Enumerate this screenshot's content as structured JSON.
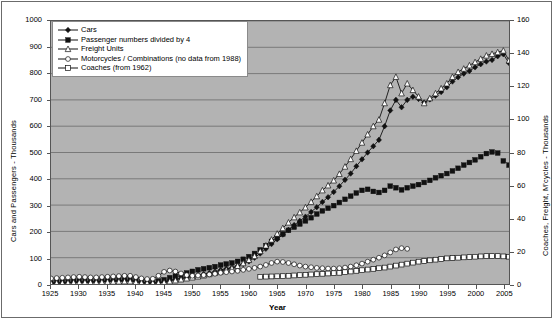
{
  "chart_data": {
    "type": "line",
    "title": "",
    "xlabel": "Year",
    "ylabel": "Cars and Passengers - Thousands",
    "y2label": "Coaches, Freight, M'cycles - Thousands",
    "xlim": [
      1925,
      2006
    ],
    "ylim": [
      0,
      1000
    ],
    "y2lim": [
      0,
      160
    ],
    "ytick_step": 100,
    "y2tick_step": 20,
    "xtick_step": 5,
    "grid": "horizontal",
    "legend_position": "top-left-inside",
    "plot_background": "#b3b3b3",
    "yticks": [
      0,
      100,
      200,
      300,
      400,
      500,
      600,
      700,
      800,
      900,
      1000
    ],
    "y2ticks": [
      0,
      20,
      40,
      60,
      80,
      100,
      120,
      140,
      160
    ],
    "xticks": [
      1925,
      1930,
      1935,
      1940,
      1945,
      1950,
      1955,
      1960,
      1965,
      1970,
      1975,
      1980,
      1985,
      1990,
      1995,
      2000,
      2005
    ],
    "series": [
      {
        "name": "Cars",
        "axis": "left",
        "marker": "filled-diamond",
        "color": "#1a1a1a",
        "line": true,
        "x": [
          1925,
          1926,
          1927,
          1928,
          1929,
          1930,
          1931,
          1932,
          1933,
          1934,
          1935,
          1936,
          1937,
          1938,
          1939,
          1940,
          1941,
          1942,
          1943,
          1944,
          1945,
          1946,
          1947,
          1948,
          1949,
          1950,
          1951,
          1952,
          1953,
          1954,
          1955,
          1956,
          1957,
          1958,
          1959,
          1960,
          1961,
          1962,
          1963,
          1964,
          1965,
          1966,
          1967,
          1968,
          1969,
          1970,
          1971,
          1972,
          1973,
          1974,
          1975,
          1976,
          1977,
          1978,
          1979,
          1980,
          1981,
          1982,
          1983,
          1984,
          1985,
          1986,
          1987,
          1988,
          1989,
          1990,
          1991,
          1992,
          1993,
          1994,
          1995,
          1996,
          1997,
          1998,
          1999,
          2000,
          2001,
          2002,
          2003,
          2004,
          2005,
          2006
        ],
        "y": [
          3,
          4,
          5,
          6,
          7,
          8,
          8,
          8,
          9,
          10,
          11,
          12,
          13,
          14,
          14,
          10,
          6,
          4,
          4,
          5,
          8,
          14,
          18,
          22,
          26,
          30,
          34,
          38,
          42,
          47,
          53,
          58,
          62,
          68,
          76,
          86,
          100,
          116,
          134,
          152,
          170,
          188,
          206,
          224,
          240,
          256,
          274,
          292,
          312,
          330,
          350,
          372,
          396,
          420,
          448,
          474,
          500,
          524,
          548,
          600,
          660,
          700,
          672,
          700,
          712,
          704,
          690,
          702,
          716,
          730,
          748,
          770,
          786,
          800,
          810,
          824,
          836,
          846,
          852,
          866,
          874,
          840
        ]
      },
      {
        "name": "Passenger numbers divided by 4",
        "axis": "left",
        "marker": "filled-square",
        "color": "#1a1a1a",
        "line": false,
        "x": [
          1925,
          1926,
          1927,
          1928,
          1929,
          1930,
          1931,
          1932,
          1933,
          1934,
          1935,
          1936,
          1937,
          1938,
          1939,
          1940,
          1941,
          1942,
          1943,
          1944,
          1945,
          1946,
          1947,
          1948,
          1949,
          1950,
          1951,
          1952,
          1953,
          1954,
          1955,
          1956,
          1957,
          1958,
          1959,
          1960,
          1961,
          1962,
          1963,
          1964,
          1965,
          1966,
          1967,
          1968,
          1969,
          1970,
          1971,
          1972,
          1973,
          1974,
          1975,
          1976,
          1977,
          1978,
          1979,
          1980,
          1981,
          1982,
          1983,
          1984,
          1985,
          1986,
          1987,
          1988,
          1989,
          1990,
          1991,
          1992,
          1993,
          1994,
          1995,
          1996,
          1997,
          1998,
          1999,
          2000,
          2001,
          2002,
          2003,
          2004,
          2005,
          2006
        ],
        "y": [
          6,
          8,
          9,
          10,
          12,
          13,
          13,
          13,
          14,
          16,
          18,
          20,
          22,
          24,
          24,
          18,
          12,
          9,
          9,
          11,
          16,
          24,
          30,
          36,
          42,
          48,
          54,
          58,
          62,
          66,
          72,
          76,
          80,
          86,
          94,
          104,
          116,
          130,
          146,
          162,
          176,
          190,
          204,
          216,
          228,
          240,
          252,
          266,
          278,
          288,
          298,
          310,
          322,
          334,
          346,
          356,
          360,
          352,
          348,
          356,
          372,
          366,
          358,
          366,
          372,
          378,
          386,
          394,
          404,
          412,
          420,
          430,
          440,
          452,
          462,
          472,
          484,
          496,
          502,
          498,
          468,
          452
        ]
      },
      {
        "name": "Freight Units",
        "axis": "right",
        "marker": "open-triangle",
        "color": "#1a1a1a",
        "line": true,
        "x": [
          1925,
          1926,
          1927,
          1928,
          1929,
          1930,
          1931,
          1932,
          1933,
          1934,
          1935,
          1936,
          1937,
          1938,
          1939,
          1940,
          1941,
          1942,
          1943,
          1944,
          1945,
          1946,
          1947,
          1948,
          1949,
          1950,
          1951,
          1952,
          1953,
          1954,
          1955,
          1956,
          1957,
          1958,
          1959,
          1960,
          1961,
          1962,
          1963,
          1964,
          1965,
          1966,
          1967,
          1968,
          1969,
          1970,
          1971,
          1972,
          1973,
          1974,
          1975,
          1976,
          1977,
          1978,
          1979,
          1980,
          1981,
          1982,
          1983,
          1984,
          1985,
          1986,
          1987,
          1988,
          1989,
          1990,
          1991,
          1992,
          1993,
          1994,
          1995,
          1996,
          1997,
          1998,
          1999,
          2000,
          2001,
          2002,
          2003,
          2004,
          2005,
          2006
        ],
        "y": [
          0.5,
          0.6,
          0.7,
          0.8,
          0.9,
          1.0,
          1.0,
          1.0,
          1.1,
          1.2,
          1.3,
          1.4,
          1.5,
          1.6,
          1.6,
          1.2,
          0.8,
          0.6,
          0.6,
          0.7,
          1.0,
          1.6,
          2.2,
          2.8,
          3.4,
          4.0,
          4.6,
          5.2,
          6.0,
          6.8,
          7.6,
          8.6,
          9.6,
          11.0,
          12.6,
          14.6,
          17.0,
          20.0,
          23.4,
          27.0,
          30.6,
          34.0,
          37.4,
          40.6,
          43.6,
          46.6,
          50.0,
          53.4,
          57.0,
          60.0,
          63.0,
          67.0,
          71.4,
          76.0,
          81.0,
          86.0,
          91.0,
          96.0,
          100.0,
          110.0,
          121.0,
          126.0,
          116.0,
          122.0,
          118.0,
          114.0,
          110.0,
          113.0,
          116.0,
          119.0,
          122.0,
          126.0,
          129.0,
          131.0,
          133.0,
          135.0,
          137.0,
          139.0,
          140.0,
          141.0,
          142.0,
          136.0
        ]
      },
      {
        "name": "Motorcycles / Combinations (no data from 1988)",
        "axis": "right",
        "marker": "open-circle",
        "color": "#1a1a1a",
        "line": true,
        "x": [
          1925,
          1926,
          1927,
          1928,
          1929,
          1930,
          1931,
          1932,
          1933,
          1934,
          1935,
          1936,
          1937,
          1938,
          1939,
          1940,
          1941,
          1942,
          1943,
          1944,
          1945,
          1946,
          1947,
          1948,
          1949,
          1950,
          1951,
          1952,
          1953,
          1954,
          1955,
          1956,
          1957,
          1958,
          1959,
          1960,
          1961,
          1962,
          1963,
          1964,
          1965,
          1966,
          1967,
          1968,
          1969,
          1970,
          1971,
          1972,
          1973,
          1974,
          1975,
          1976,
          1977,
          1978,
          1979,
          1980,
          1981,
          1982,
          1983,
          1984,
          1985,
          1986,
          1987,
          1988
        ],
        "y": [
          3.4,
          3.6,
          3.8,
          4.0,
          4.2,
          4.4,
          4.2,
          4.0,
          4.0,
          4.2,
          4.4,
          4.6,
          4.8,
          5.0,
          5.0,
          4.2,
          3.4,
          3.0,
          3.2,
          5.0,
          7.4,
          8.2,
          7.6,
          6.4,
          5.4,
          5.0,
          5.2,
          5.4,
          5.8,
          6.2,
          6.8,
          7.2,
          7.6,
          8.0,
          8.6,
          9.2,
          9.8,
          10.6,
          11.6,
          12.8,
          13.6,
          13.4,
          12.8,
          12.0,
          11.2,
          10.6,
          10.2,
          9.8,
          9.6,
          9.4,
          9.4,
          9.6,
          10.0,
          10.6,
          11.4,
          12.4,
          13.6,
          14.8,
          16.0,
          17.4,
          19.2,
          21.0,
          21.8,
          21.4
        ]
      },
      {
        "name": "Coaches (from 1962)",
        "axis": "right",
        "marker": "open-square",
        "color": "#1a1a1a",
        "line": true,
        "x": [
          1962,
          1963,
          1964,
          1965,
          1966,
          1967,
          1968,
          1969,
          1970,
          1971,
          1972,
          1973,
          1974,
          1975,
          1976,
          1977,
          1978,
          1979,
          1980,
          1981,
          1982,
          1983,
          1984,
          1985,
          1986,
          1987,
          1988,
          1989,
          1990,
          1991,
          1992,
          1993,
          1994,
          1995,
          1996,
          1997,
          1998,
          1999,
          2000,
          2001,
          2002,
          2003,
          2004,
          2005,
          2006
        ],
        "y": [
          4.4,
          4.5,
          4.6,
          4.7,
          4.8,
          5.0,
          5.2,
          5.4,
          5.6,
          5.8,
          6.0,
          6.2,
          6.4,
          6.6,
          6.8,
          7.2,
          7.6,
          8.0,
          8.4,
          8.8,
          9.2,
          9.6,
          10.0,
          10.6,
          11.2,
          11.8,
          12.4,
          13.0,
          13.6,
          14.0,
          14.4,
          14.8,
          15.2,
          15.6,
          15.8,
          16.0,
          16.2,
          16.4,
          16.6,
          16.8,
          17.0,
          17.0,
          17.0,
          16.8,
          16.6
        ]
      }
    ]
  },
  "legend": {
    "items": [
      {
        "label": "Cars",
        "marker": "filled-diamond"
      },
      {
        "label": "Passenger numbers divided by 4",
        "marker": "filled-square"
      },
      {
        "label": "Freight Units",
        "marker": "open-triangle"
      },
      {
        "label": "Motorcycles / Combinations (no data from 1988)",
        "marker": "open-circle"
      },
      {
        "label": "Coaches (from 1962)",
        "marker": "open-square"
      }
    ]
  }
}
